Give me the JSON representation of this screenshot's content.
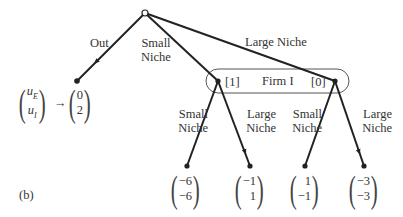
{
  "figure_label": "(b)",
  "root": {
    "type": "open-circle",
    "player": "Firm E"
  },
  "info_set": {
    "label": "Firm I",
    "left_belief": "[1]",
    "right_belief": "[0]"
  },
  "edges": {
    "out": "Out",
    "small_niche_line1": "Small",
    "small_niche_line2": "Niche",
    "large_niche": "Large Niche",
    "left_small_line1": "Small",
    "left_small_line2": "Niche",
    "left_large_line1": "Large",
    "left_large_line2": "Niche",
    "right_small_line1": "Small",
    "right_small_line2": "Niche",
    "right_large_line1": "Large",
    "right_large_line2": "Niche"
  },
  "payoff_legend": {
    "top": "u",
    "top_sub": "E",
    "bottom": "u",
    "bottom_sub": "I",
    "arrow": "→"
  },
  "payoffs": {
    "out": {
      "uE": "0",
      "uI": "2"
    },
    "small_small": {
      "uE": "−6",
      "uI": "−6"
    },
    "small_large": {
      "uE": "−1",
      "uI": "1"
    },
    "large_small": {
      "uE": "1",
      "uI": "−1"
    },
    "large_large": {
      "uE": "−3",
      "uI": "−3"
    }
  }
}
